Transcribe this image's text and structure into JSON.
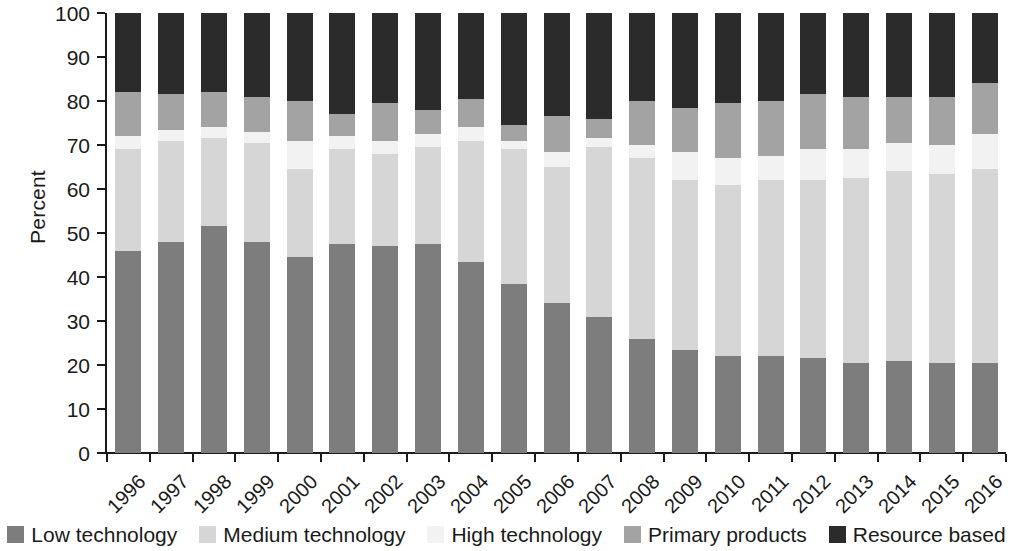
{
  "chart_data": {
    "type": "bar",
    "stacked": true,
    "title": "",
    "subtitle": "",
    "xlabel": "",
    "ylabel": "Percent",
    "ylim": [
      0,
      100
    ],
    "yticks": [
      0,
      10,
      20,
      30,
      40,
      50,
      60,
      70,
      80,
      90,
      100
    ],
    "grid": false,
    "legend_position": "bottom",
    "categories": [
      "1996",
      "1997",
      "1998",
      "1999",
      "2000",
      "2001",
      "2002",
      "2003",
      "2004",
      "2005",
      "2006",
      "2007",
      "2008",
      "2009",
      "2010",
      "2011",
      "2012",
      "2013",
      "2014",
      "2015",
      "2016"
    ],
    "series": [
      {
        "name": "Low technology",
        "color": "#7d7d7d",
        "values": [
          46.0,
          48.0,
          51.5,
          48.0,
          44.5,
          47.5,
          47.0,
          47.5,
          43.5,
          38.5,
          34.0,
          31.0,
          26.0,
          23.5,
          22.0,
          22.0,
          21.5,
          20.5,
          21.0,
          20.5,
          20.5
        ]
      },
      {
        "name": "Medium technology",
        "color": "#d6d6d6",
        "values": [
          23.0,
          23.0,
          20.0,
          22.5,
          20.0,
          21.5,
          21.0,
          22.0,
          27.5,
          30.5,
          31.0,
          38.5,
          41.0,
          38.5,
          39.0,
          40.0,
          40.5,
          42.0,
          43.0,
          43.0,
          44.0
        ]
      },
      {
        "name": "High technology",
        "color": "#f2f2f2",
        "values": [
          3.0,
          2.5,
          2.5,
          2.5,
          6.5,
          3.0,
          3.0,
          3.0,
          3.0,
          2.0,
          3.5,
          2.0,
          3.0,
          6.5,
          6.0,
          5.5,
          7.0,
          6.5,
          6.5,
          6.5,
          8.0
        ]
      },
      {
        "name": "Primary products",
        "color": "#a3a3a3",
        "values": [
          10.0,
          8.0,
          8.0,
          8.0,
          9.0,
          5.0,
          8.5,
          5.5,
          6.5,
          3.5,
          8.0,
          4.5,
          10.0,
          10.0,
          12.5,
          12.5,
          12.5,
          12.0,
          10.5,
          11.0,
          11.5
        ]
      },
      {
        "name": "Resource based",
        "color": "#2b2b2b",
        "values": [
          18.0,
          18.5,
          18.0,
          19.0,
          20.0,
          23.0,
          20.5,
          22.0,
          19.5,
          25.5,
          23.5,
          24.0,
          20.0,
          21.5,
          20.5,
          20.0,
          18.5,
          19.0,
          19.0,
          19.0,
          16.0
        ]
      }
    ],
    "cumulative_boundaries": {
      "note": "Top edge of each stack level, bottom-up, in percent",
      "low_technology": [
        46.0,
        48.0,
        51.5,
        48.0,
        44.5,
        47.5,
        47.0,
        47.5,
        43.5,
        38.5,
        34.0,
        31.0,
        26.0,
        23.5,
        22.0,
        22.0,
        21.5,
        20.5,
        21.0,
        20.5,
        20.5
      ],
      "medium_technology": [
        69.0,
        71.0,
        71.5,
        70.5,
        64.5,
        69.0,
        68.0,
        69.5,
        71.0,
        69.0,
        65.0,
        69.5,
        67.0,
        62.0,
        61.0,
        62.0,
        62.0,
        62.5,
        64.0,
        63.5,
        64.5
      ],
      "high_technology": [
        72.0,
        73.5,
        74.0,
        73.0,
        71.0,
        72.0,
        71.0,
        72.5,
        74.0,
        71.0,
        68.5,
        71.5,
        70.0,
        68.5,
        67.0,
        67.5,
        69.0,
        69.0,
        70.5,
        70.0,
        72.5
      ],
      "primary_products": [
        82.0,
        81.5,
        82.0,
        81.0,
        80.0,
        77.0,
        79.5,
        78.0,
        80.5,
        74.5,
        76.5,
        76.0,
        80.0,
        78.5,
        79.5,
        80.0,
        81.5,
        81.0,
        81.0,
        81.0,
        84.0
      ],
      "resource_based": [
        100,
        100,
        100,
        100,
        100,
        100,
        100,
        100,
        100,
        100,
        100,
        100,
        100,
        100,
        100,
        100,
        100,
        100,
        100,
        100,
        100
      ]
    }
  },
  "axis": {
    "y_label": "Percent",
    "y_tick_labels": [
      "0",
      "10",
      "20",
      "30",
      "40",
      "50",
      "60",
      "70",
      "80",
      "90",
      "100"
    ],
    "x_tick_labels": [
      "1996",
      "1997",
      "1998",
      "1999",
      "2000",
      "2001",
      "2002",
      "2003",
      "2004",
      "2005",
      "2006",
      "2007",
      "2008",
      "2009",
      "2010",
      "2011",
      "2012",
      "2013",
      "2014",
      "2015",
      "2016"
    ]
  },
  "legend": {
    "items": [
      {
        "label": "Low technology",
        "color": "#7d7d7d"
      },
      {
        "label": "Medium technology",
        "color": "#d6d6d6"
      },
      {
        "label": "High technology",
        "color": "#f2f2f2"
      },
      {
        "label": "Primary products",
        "color": "#a3a3a3"
      },
      {
        "label": "Resource based",
        "color": "#2b2b2b"
      }
    ]
  },
  "colors": {
    "axis": "#1a1a1a",
    "text": "#1a1a1a",
    "background": "#ffffff",
    "low_technology": "#7d7d7d",
    "medium_technology": "#d6d6d6",
    "high_technology": "#f2f2f2",
    "primary_products": "#a3a3a3",
    "resource_based": "#2b2b2b"
  }
}
